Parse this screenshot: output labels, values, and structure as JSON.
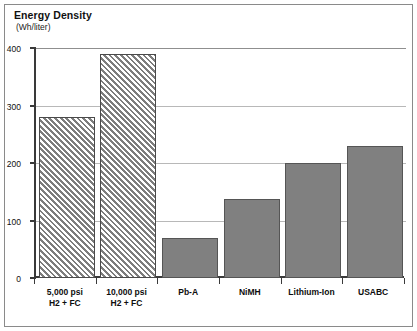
{
  "chart_data": {
    "type": "bar",
    "title": "Energy Density",
    "subtitle": "(Wh/liter)",
    "xlabel": "",
    "ylabel": "",
    "ylim": [
      0,
      400
    ],
    "yticks": [
      "0",
      "100",
      "200",
      "300",
      "400"
    ],
    "ytick_values": [
      0,
      100,
      200,
      300,
      400
    ],
    "grid": true,
    "legend": "none",
    "categories": [
      "5,000 psi H2 + FC",
      "10,000 psi H2 + FC",
      "Pb-A",
      "NiMH",
      "Lithium-Ion",
      "USABC"
    ],
    "values": [
      280,
      390,
      70,
      138,
      200,
      230
    ],
    "bars": [
      {
        "label_line1": "5,000 psi",
        "label_line2": "H2 + FC",
        "value": 280,
        "fill": "hatched"
      },
      {
        "label_line1": "10,000 psi",
        "label_line2": "H2 + FC",
        "value": 390,
        "fill": "hatched"
      },
      {
        "label_line1": "Pb-A",
        "label_line2": "",
        "value": 70,
        "fill": "solid"
      },
      {
        "label_line1": "NiMH",
        "label_line2": "",
        "value": 138,
        "fill": "solid"
      },
      {
        "label_line1": "Lithium-Ion",
        "label_line2": "",
        "value": 200,
        "fill": "solid"
      },
      {
        "label_line1": "USABC",
        "label_line2": "",
        "value": 230,
        "fill": "solid"
      }
    ],
    "colors": {
      "solid_fill": "#808080",
      "hatch_line": "#7d7d7d",
      "bar_border": "#4a4a4a",
      "axis": "#3a3a3a",
      "gridline": "#b8b8b8",
      "frame": "#8a8a8a",
      "background": "#ffffff",
      "text": "#111111"
    }
  }
}
